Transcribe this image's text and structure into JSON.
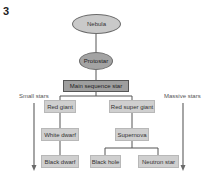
{
  "figure_number": "3",
  "nodes": {
    "nebula": "Nebula",
    "protostar": "Protostar",
    "main_sequence": "Main sequence star",
    "red_giant": "Red giant",
    "white_dwarf": "White dwarf",
    "black_dwarf": "Black dwarf",
    "red_super_giant": "Red super giant",
    "supernova": "Supernova",
    "black_hole": "Black hole",
    "neutron_star": "Neutron star"
  },
  "side_labels": {
    "left": "Small stars",
    "right": "Massive stars"
  },
  "colors": {
    "nebula_fill": "#c9c9c9",
    "protostar_fill": "#a3a3a3",
    "main_sequence_fill": "#9e9e9e",
    "box_fill": "#cfcfcf",
    "line": "#555555",
    "arrow": "#6a6a6a"
  }
}
